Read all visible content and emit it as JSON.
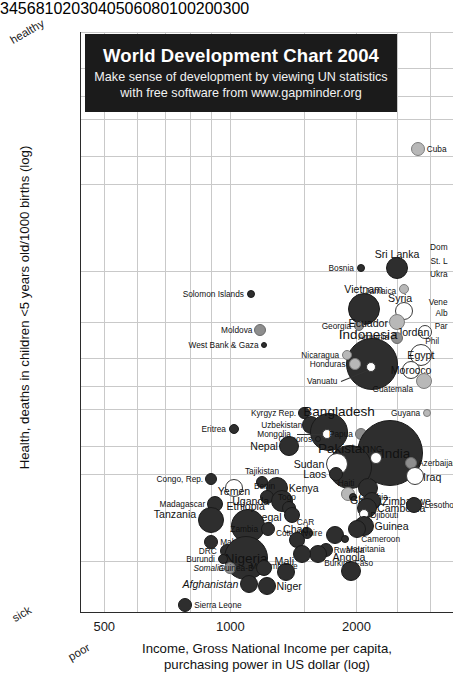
{
  "banner": {
    "title": "World Development Chart 2004",
    "subtitle_line1": "Make sense of development by viewing UN statistics",
    "subtitle_line2": "with free software from www.gapminder.org"
  },
  "corners": {
    "healthy": "healthy",
    "sick": "sick",
    "poor": "poor"
  },
  "chart_data": {
    "type": "scatter",
    "title": "World Development Chart 2004",
    "subtitle": "Make sense of development by viewing UN statistics with free software from www.gapminder.org",
    "xlabel": "Income, Gross National Income per capita, purchasing power in US dollar (log)",
    "ylabel": "Health, deaths in children <5 years old/1000 births (log)",
    "xscale": "log",
    "yscale": "log",
    "y_inverted": true,
    "xlim": [
      440,
      3400
    ],
    "ylim": [
      3,
      300
    ],
    "grid": true,
    "legend": "none",
    "xticks": [
      500,
      1000,
      2000
    ],
    "yticks": [
      3,
      4,
      5,
      6,
      8,
      10,
      20,
      30,
      40,
      50,
      60,
      80,
      100,
      200,
      300
    ],
    "xtick_labels": [
      "500",
      "1000",
      "2000"
    ],
    "ytick_labels": [
      "3",
      "4",
      "5",
      "6",
      "8",
      "10",
      "20",
      "30",
      "40",
      "50",
      "60",
      "80",
      "100",
      "200",
      "300"
    ],
    "bubble_encoding": "population",
    "color_encoding": "region/shade",
    "points": [
      {
        "name": "Cuba",
        "x": 2800,
        "y": 7.6,
        "r": 7,
        "tone": "light",
        "lpos": "l",
        "ldx": 9,
        "ldy": 0
      },
      {
        "name": "Dom",
        "x": 3300,
        "y": 16.5,
        "r": 0,
        "tone": "dark",
        "lpos": "r",
        "ldx": 0,
        "ldy": 0
      },
      {
        "name": "St. L",
        "x": 3300,
        "y": 18.5,
        "r": 0,
        "tone": "dark",
        "lpos": "r",
        "ldx": 0,
        "ldy": 0
      },
      {
        "name": "Ukra",
        "x": 3300,
        "y": 20.5,
        "r": 0,
        "tone": "dark",
        "lpos": "r",
        "ldx": 0,
        "ldy": 0
      },
      {
        "name": "Sri Lanka",
        "x": 2500,
        "y": 19.5,
        "r": 11,
        "tone": "dark",
        "lpos": "c",
        "ldx": 0,
        "ldy": -14
      },
      {
        "name": "Bosnia",
        "x": 2050,
        "y": 19.5,
        "r": 4,
        "tone": "dark",
        "lpos": "r",
        "ldx": -7,
        "ldy": 0
      },
      {
        "name": "Jamaica",
        "x": 2600,
        "y": 23,
        "r": 5,
        "tone": "light",
        "lpos": "r",
        "ldx": -8,
        "ldy": 2
      },
      {
        "name": "Vene",
        "x": 3300,
        "y": 25.5,
        "r": 0,
        "tone": "dark",
        "lpos": "r",
        "ldx": 0,
        "ldy": 0
      },
      {
        "name": "Alb",
        "x": 3300,
        "y": 28,
        "r": 0,
        "tone": "dark",
        "lpos": "r",
        "ldx": 0,
        "ldy": 0
      },
      {
        "name": "Par",
        "x": 3300,
        "y": 31,
        "r": 0,
        "tone": "dark",
        "lpos": "r",
        "ldx": 0,
        "ldy": 0
      },
      {
        "name": "Solomon Islands",
        "x": 1120,
        "y": 24,
        "r": 4,
        "tone": "dark",
        "lpos": "r",
        "ldx": -7,
        "ldy": 0
      },
      {
        "name": "Vietnam",
        "x": 2080,
        "y": 27,
        "r": 16,
        "tone": "dark",
        "lpos": "c",
        "ldx": 0,
        "ldy": -20
      },
      {
        "name": "Georgia",
        "x": 2030,
        "y": 31,
        "r": 5,
        "tone": "mid",
        "lpos": "r",
        "ldx": -8,
        "ldy": 0
      },
      {
        "name": "Syria",
        "x": 2600,
        "y": 27.5,
        "r": 9,
        "tone": "white",
        "lpos": "c",
        "ldx": -4,
        "ldy": -13
      },
      {
        "name": "Ecuador",
        "x": 2500,
        "y": 30,
        "r": 8,
        "tone": "light",
        "lpos": "r",
        "ldx": -9,
        "ldy": 1
      },
      {
        "name": "Jordan",
        "x": 2920,
        "y": 32.5,
        "r": 7,
        "tone": "white",
        "lpos": "r",
        "ldx": 4,
        "ldy": 0
      },
      {
        "name": "Phil",
        "x": 3150,
        "y": 35,
        "r": 0,
        "tone": "dark",
        "lpos": "r",
        "ldx": 0,
        "ldy": 0
      },
      {
        "name": "Moldova",
        "x": 1180,
        "y": 32,
        "r": 6,
        "tone": "mid",
        "lpos": "r",
        "ldx": -8,
        "ldy": 0
      },
      {
        "name": "West Bank & Gaza",
        "x": 1200,
        "y": 36,
        "r": 3,
        "tone": "dark",
        "lpos": "r",
        "ldx": -5,
        "ldy": 0
      },
      {
        "name": "Armenia",
        "x": 2500,
        "y": 34,
        "r": 6,
        "tone": "mid",
        "lpos": "r",
        "ldx": -8,
        "ldy": -1
      },
      {
        "name": "Indonesia",
        "x": 2180,
        "y": 42,
        "r": 26,
        "tone": "dark",
        "lpos": "c",
        "ldx": -4,
        "ldy": -30
      },
      {
        "name": "Egypt",
        "x": 2850,
        "y": 39,
        "r": 11,
        "tone": "white",
        "lpos": "c",
        "ldx": 0,
        "ldy": 0
      },
      {
        "name": "Nicaragua",
        "x": 1900,
        "y": 39,
        "r": 5,
        "tone": "light",
        "lpos": "r",
        "ldx": -8,
        "ldy": 0
      },
      {
        "name": "Honduras",
        "x": 1980,
        "y": 42,
        "r": 6,
        "tone": "light",
        "lpos": "r",
        "ldx": -9,
        "ldy": 0
      },
      {
        "name": "Morocco",
        "x": 2700,
        "y": 44,
        "r": 9,
        "tone": "white",
        "lpos": "c",
        "ldx": 0,
        "ldy": 0
      },
      {
        "name": "Vanuatu",
        "x": 2170,
        "y": 43,
        "r": 5,
        "tone": "white",
        "lpos": "r",
        "ldx": -34,
        "ldy": 14
      },
      {
        "name": "Guatemala",
        "x": 2900,
        "y": 48,
        "r": 8,
        "tone": "light",
        "lpos": "r",
        "ldx": -11,
        "ldy": 8
      },
      {
        "name": "Guyana",
        "x": 2950,
        "y": 62,
        "r": 4,
        "tone": "light",
        "lpos": "r",
        "ldx": -7,
        "ldy": 0
      },
      {
        "name": "Kyrgyz Rep.",
        "x": 1500,
        "y": 62,
        "r": 6,
        "tone": "dark",
        "lpos": "r",
        "ldx": -8,
        "ldy": 0
      },
      {
        "name": "Uzbekistan",
        "x": 1560,
        "y": 68,
        "r": 9,
        "tone": "dark",
        "lpos": "r",
        "ldx": -9,
        "ldy": 0
      },
      {
        "name": "Bangladesh",
        "x": 1720,
        "y": 72,
        "r": 19,
        "tone": "dark",
        "lpos": "c",
        "ldx": 10,
        "ldy": -21
      },
      {
        "name": "Mongolia",
        "x": 1700,
        "y": 73,
        "r": 5,
        "tone": "white",
        "lpos": "r",
        "ldx": -36,
        "ldy": 0
      },
      {
        "name": "Comoros",
        "x": 1620,
        "y": 76,
        "r": 3,
        "tone": "dark",
        "lpos": "r",
        "ldx": -6,
        "ldy": 0
      },
      {
        "name": "Papua",
        "x": 2050,
        "y": 73,
        "r": 6,
        "tone": "mid",
        "lpos": "r",
        "ldx": -8,
        "ldy": 0
      },
      {
        "name": "Bolivia",
        "x": 2250,
        "y": 72,
        "r": 7,
        "tone": "mid",
        "lpos": "l",
        "ldx": 7,
        "ldy": 0
      },
      {
        "name": "India",
        "x": 2400,
        "y": 85,
        "r": 33,
        "tone": "dark",
        "lpos": "c",
        "ldx": 6,
        "ldy": 0
      },
      {
        "name": "Nepal",
        "x": 1380,
        "y": 80,
        "r": 10,
        "tone": "dark",
        "lpos": "r",
        "ldx": -11,
        "ldy": 0
      },
      {
        "name": "Eritrea",
        "x": 1020,
        "y": 70,
        "r": 5,
        "tone": "dark",
        "lpos": "r",
        "ldx": -8,
        "ldy": 0
      },
      {
        "name": "Pakistan",
        "x": 1930,
        "y": 95,
        "r": 22,
        "tone": "dark",
        "lpos": "c",
        "ldx": -6,
        "ldy": -19
      },
      {
        "name": "Sudan",
        "x": 1800,
        "y": 93,
        "r": 11,
        "tone": "white",
        "lpos": "r",
        "ldx": -13,
        "ldy": 0
      },
      {
        "name": "NG",
        "x": 2230,
        "y": 88,
        "r": 6,
        "tone": "white",
        "lpos": "c",
        "ldx": 0,
        "ldy": -9
      },
      {
        "name": "Azerbaijan",
        "x": 2700,
        "y": 92,
        "r": 6,
        "tone": "mid",
        "lpos": "l",
        "ldx": 7,
        "ldy": 0
      },
      {
        "name": "Laos",
        "x": 1790,
        "y": 100,
        "r": 7,
        "tone": "dark",
        "lpos": "r",
        "ldx": -10,
        "ldy": 0
      },
      {
        "name": "Iraq",
        "x": 2760,
        "y": 102,
        "r": 9,
        "tone": "white",
        "lpos": "l",
        "ldx": 8,
        "ldy": 1
      },
      {
        "name": "Congo, Rep.",
        "x": 900,
        "y": 104,
        "r": 6,
        "tone": "dark",
        "lpos": "r",
        "ldx": -8,
        "ldy": 0
      },
      {
        "name": "Tajikistan",
        "x": 1190,
        "y": 107,
        "r": 6,
        "tone": "dark",
        "lpos": "c",
        "ldx": 0,
        "ldy": -11
      },
      {
        "name": "Yemen",
        "x": 1020,
        "y": 112,
        "r": 9,
        "tone": "white",
        "lpos": "c",
        "ldx": 0,
        "ldy": 3
      },
      {
        "name": "Kenya",
        "x": 1290,
        "y": 112,
        "r": 11,
        "tone": "dark",
        "lpos": "l",
        "ldx": 12,
        "ldy": 0
      },
      {
        "name": "Benin",
        "x": 1220,
        "y": 120,
        "r": 7,
        "tone": "dark",
        "lpos": "c",
        "ldx": -2,
        "ldy": -11
      },
      {
        "name": "Uganda",
        "x": 1330,
        "y": 124,
        "r": 11,
        "tone": "dark",
        "lpos": "r",
        "ldx": -13,
        "ldy": 0
      },
      {
        "name": "Haiti",
        "x": 1910,
        "y": 118,
        "r": 7,
        "tone": "light",
        "lpos": "c",
        "ldx": -2,
        "ldy": -11
      },
      {
        "name": "Gambia",
        "x": 1960,
        "y": 120,
        "r": 4,
        "tone": "dark",
        "lpos": "l",
        "ldx": 6,
        "ldy": 0
      },
      {
        "name": "Ghana",
        "x": 2130,
        "y": 112,
        "r": 10,
        "tone": "dark",
        "lpos": "c",
        "ldx": -2,
        "ldy": 12
      },
      {
        "name": "Zimbabwe",
        "x": 2180,
        "y": 124,
        "r": 9,
        "tone": "dark",
        "lpos": "l",
        "ldx": 10,
        "ldy": 0
      },
      {
        "name": "Cambodia",
        "x": 2120,
        "y": 131,
        "r": 10,
        "tone": "dark",
        "lpos": "l",
        "ldx": 10,
        "ldy": 0
      },
      {
        "name": "Lesotho",
        "x": 2750,
        "y": 128,
        "r": 8,
        "tone": "dark",
        "lpos": "l",
        "ldx": 10,
        "ldy": 0
      },
      {
        "name": "Djibouti",
        "x": 2080,
        "y": 138,
        "r": 5,
        "tone": "white",
        "lpos": "l",
        "ldx": 7,
        "ldy": 1
      },
      {
        "name": "Madagascar",
        "x": 920,
        "y": 127,
        "r": 8,
        "tone": "dark",
        "lpos": "r",
        "ldx": -10,
        "ldy": 0
      },
      {
        "name": "Togo",
        "x": 1380,
        "y": 131,
        "r": 7,
        "tone": "dark",
        "lpos": "c",
        "ldx": -2,
        "ldy": -11
      },
      {
        "name": "Senegal",
        "x": 1400,
        "y": 139,
        "r": 8,
        "tone": "dark",
        "lpos": "r",
        "ldx": -10,
        "ldy": 2
      },
      {
        "name": "Tanzania",
        "x": 900,
        "y": 145,
        "r": 13,
        "tone": "dark",
        "lpos": "r",
        "ldx": -15,
        "ldy": -6
      },
      {
        "name": "Ethiopia",
        "x": 1100,
        "y": 152,
        "r": 17,
        "tone": "dark",
        "lpos": "c",
        "ldx": -2,
        "ldy": -20
      },
      {
        "name": "Zambia",
        "x": 1230,
        "y": 155,
        "r": 7,
        "tone": "dark",
        "lpos": "r",
        "ldx": -10,
        "ldy": 0
      },
      {
        "name": "CAR",
        "x": 1520,
        "y": 160,
        "r": 6,
        "tone": "dark",
        "lpos": "c",
        "ldx": -1,
        "ldy": -11
      },
      {
        "name": "Guinea",
        "x": 2090,
        "y": 152,
        "r": 10,
        "tone": "dark",
        "lpos": "l",
        "ldx": 10,
        "ldy": 0
      },
      {
        "name": "Cameroon",
        "x": 2010,
        "y": 155,
        "r": 9,
        "tone": "dark",
        "lpos": "l",
        "ldx": 4,
        "ldy": 10
      },
      {
        "name": "Cote d'Ivoire",
        "x": 1780,
        "y": 163,
        "r": 9,
        "tone": "dark",
        "lpos": "r",
        "ldx": -13,
        "ldy": -2
      },
      {
        "name": "Mauritania",
        "x": 1880,
        "y": 168,
        "r": 4,
        "tone": "dark",
        "lpos": "l",
        "ldx": 1,
        "ldy": 10
      },
      {
        "name": "Chad",
        "x": 1440,
        "y": 170,
        "r": 8,
        "tone": "dark",
        "lpos": "c",
        "ldx": -1,
        "ldy": -11
      },
      {
        "name": "Malawi",
        "x": 900,
        "y": 172,
        "r": 7,
        "tone": "dark",
        "lpos": "l",
        "ldx": 9,
        "ldy": 0
      },
      {
        "name": "DRC",
        "x": 980,
        "y": 185,
        "r": 7,
        "tone": "dark",
        "lpos": "r",
        "ldx": -10,
        "ldy": 0
      },
      {
        "name": "Nigeria",
        "x": 1090,
        "y": 195,
        "r": 22,
        "tone": "dark",
        "lpos": "c",
        "ldx": 0,
        "ldy": 0
      },
      {
        "name": "Rwanda",
        "x": 1690,
        "y": 183,
        "r": 7,
        "tone": "dark",
        "lpos": "l",
        "ldx": 8,
        "ldy": 0
      },
      {
        "name": "Burkina Faso",
        "x": 1620,
        "y": 190,
        "r": 9,
        "tone": "dark",
        "lpos": "l",
        "ldx": 6,
        "ldy": 9
      },
      {
        "name": "Mozambique",
        "x": 1480,
        "y": 190,
        "r": 9,
        "tone": "dark",
        "lpos": "r",
        "ldx": -4,
        "ldy": 12
      },
      {
        "name": "Burundi",
        "x": 960,
        "y": 197,
        "r": 5,
        "tone": "dark",
        "lpos": "r",
        "ldx": -8,
        "ldy": 0
      },
      {
        "name": "Somalia",
        "x": 1000,
        "y": 211,
        "r": 6,
        "tone": "mid",
        "lpos": "r",
        "ldx": -7,
        "ldy": 0
      },
      {
        "name": "Guinea-B",
        "x": 1200,
        "y": 212,
        "r": 8,
        "tone": "dark",
        "lpos": "r",
        "ldx": -10,
        "ldy": 0
      },
      {
        "name": "Mali",
        "x": 1360,
        "y": 218,
        "r": 9,
        "tone": "dark",
        "lpos": "c",
        "ldx": -2,
        "ldy": -11
      },
      {
        "name": "Angola",
        "x": 1940,
        "y": 217,
        "r": 10,
        "tone": "dark",
        "lpos": "c",
        "ldx": -2,
        "ldy": -14
      },
      {
        "name": "Afghanistan",
        "x": 1110,
        "y": 240,
        "r": 9,
        "tone": "dark",
        "lpos": "r",
        "ldx": -11,
        "ldy": 0
      },
      {
        "name": "Niger",
        "x": 1220,
        "y": 245,
        "r": 9,
        "tone": "dark",
        "lpos": "l",
        "ldx": 10,
        "ldy": 0
      },
      {
        "name": "Sierra Leone",
        "x": 780,
        "y": 283,
        "r": 7,
        "tone": "dark",
        "lpos": "l",
        "ldx": 9,
        "ldy": 0
      }
    ]
  }
}
